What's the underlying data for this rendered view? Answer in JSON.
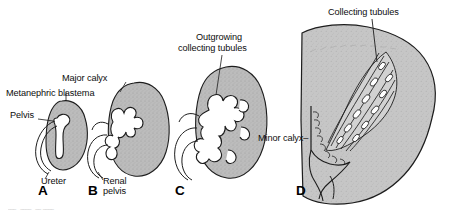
{
  "figure": {
    "background_color": "#ffffff",
    "tissue_fill_color": "#b9b9b9",
    "lumen_fill_color": "#ffffff",
    "outline_color": "#1a1a1a"
  },
  "panels": [
    {
      "letter": "A",
      "name": "panel-a",
      "labels": [
        {
          "id": "metanephric-blastema",
          "text": "Metanephric blastema"
        },
        {
          "id": "pelvis",
          "text": "Pelvis"
        },
        {
          "id": "ureter",
          "text": "Ureter"
        }
      ]
    },
    {
      "letter": "B",
      "name": "panel-b",
      "labels": [
        {
          "id": "major-calyx",
          "text": "Major calyx"
        },
        {
          "id": "renal-pelvis-line1",
          "text": "Renal"
        },
        {
          "id": "renal-pelvis-line2",
          "text": "pelvis"
        }
      ]
    },
    {
      "letter": "C",
      "name": "panel-c",
      "labels": [
        {
          "id": "outgrowing-line1",
          "text": "Outgrowing"
        },
        {
          "id": "outgrowing-line2",
          "text": "collecting tubules"
        },
        {
          "id": "minor-calyx",
          "text": "Minor calyx–"
        }
      ]
    },
    {
      "letter": "D",
      "name": "panel-d",
      "labels": [
        {
          "id": "collecting-tubules",
          "text": "Collecting tubules"
        }
      ]
    }
  ],
  "caption": {
    "cropped_text": "‾‾‾  ‾‾‾‾  ‾‾ ‾‾‾‾"
  }
}
